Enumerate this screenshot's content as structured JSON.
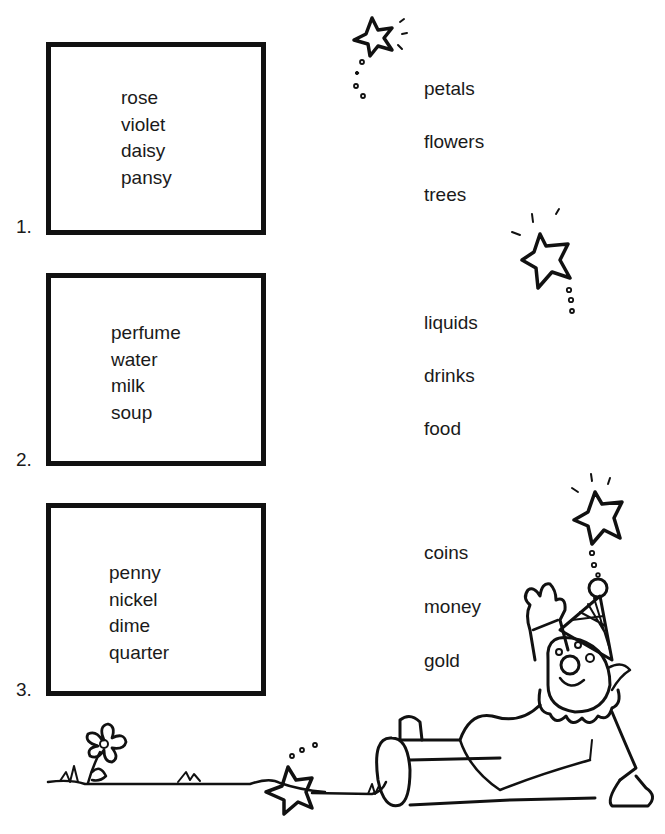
{
  "exercises": [
    {
      "number": "1.",
      "words": [
        "rose",
        "violet",
        "daisy",
        "pansy"
      ],
      "choices": [
        "petals",
        "flowers",
        "trees"
      ]
    },
    {
      "number": "2.",
      "words": [
        "perfume",
        "water",
        "milk",
        "soup"
      ],
      "choices": [
        "liquids",
        "drinks",
        "food"
      ]
    },
    {
      "number": "3.",
      "words": [
        "penny",
        "nickel",
        "dime",
        "quarter"
      ],
      "choices": [
        "coins",
        "money",
        "gold"
      ]
    }
  ],
  "illustrations": [
    "star-icon",
    "flower-icon",
    "clown-illustration",
    "grass-ground"
  ]
}
